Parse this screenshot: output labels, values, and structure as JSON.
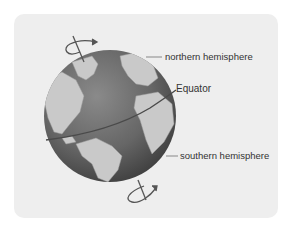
{
  "diagram": {
    "labels": {
      "north": "northern hemisphere",
      "equator": "Equator",
      "south": "southern hemisphere"
    },
    "icons": {
      "top_rotation": "rotation-arrow-icon",
      "bottom_rotation": "rotation-arrow-icon"
    },
    "colors": {
      "card_background": "#eeeeee",
      "ocean": "#6f6f6f",
      "land": "#c8c8c8",
      "equator_line": "#555555",
      "leader_line": "#888888",
      "text": "#333333"
    }
  }
}
